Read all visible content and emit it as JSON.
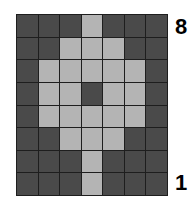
{
  "grid": {
    "cols": 7,
    "rows": 8,
    "colors": {
      "off": "#4a4a4a",
      "on": "#b4b4b4",
      "line": "#1e1e1e"
    },
    "cells": [
      [
        0,
        0,
        0,
        1,
        0,
        0,
        0
      ],
      [
        0,
        0,
        1,
        1,
        1,
        0,
        0
      ],
      [
        0,
        1,
        1,
        1,
        1,
        1,
        0
      ],
      [
        0,
        1,
        1,
        0,
        1,
        1,
        0
      ],
      [
        0,
        1,
        1,
        1,
        1,
        1,
        0
      ],
      [
        0,
        0,
        1,
        1,
        1,
        0,
        0
      ],
      [
        0,
        0,
        0,
        1,
        0,
        0,
        0
      ],
      [
        0,
        0,
        0,
        1,
        0,
        0,
        0
      ]
    ]
  },
  "labels": {
    "top": "8",
    "bottom": "1"
  }
}
